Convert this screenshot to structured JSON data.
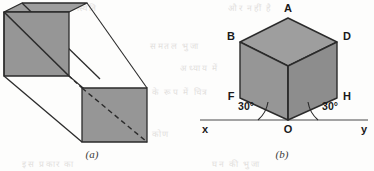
{
  "page": {
    "width": 374,
    "height": 171,
    "background_color": "#fdfdfc"
  },
  "style": {
    "fill_gray": "#969696",
    "fill_gray_light": "#9e9e9e",
    "fill_gray_dark": "#8d8d8d",
    "stroke_color": "#2b2b2b",
    "axis_color": "#4a4a4a",
    "label_color": "#1a1a1a",
    "stroke_width": 1.3
  },
  "figures": [
    {
      "id": "figure-a",
      "caption": "(a)",
      "type": "oblique-square-prism",
      "description": "Long square prism in oblique projection running from upper-left to lower-right, with the near square face and the far square face shaded and each crossed by a diagonal; the far diagonal is dashed because it is hidden.",
      "front_face": {
        "name": "near-square-face",
        "points": "4,12 69,12 69,76 4,76",
        "diagonal": {
          "from": "4,12",
          "to": "69,76",
          "style": "solid"
        }
      },
      "top_cap_face": {
        "name": "top-cap-face",
        "points": "4,12 22,3 87,3 69,12"
      },
      "back_face": {
        "name": "far-square-face",
        "points": "82,88 147,88 147,142 82,142",
        "diagonal": {
          "from": "82,88",
          "to": "147,142",
          "style": "dashed"
        }
      },
      "connector_edges": [
        {
          "name": "edge-top-left",
          "from": "22,3",
          "to": "99,79"
        },
        {
          "name": "edge-top-right",
          "from": "87,3",
          "to": "147,88"
        },
        {
          "name": "edge-bottom-left",
          "from": "4,76",
          "to": "82,142"
        },
        {
          "name": "edge-inner-dashed",
          "from": "69,76",
          "to": "82,88",
          "style": "dashed"
        }
      ]
    },
    {
      "id": "figure-b",
      "caption": "(b)",
      "type": "isometric-cube-on-vertex",
      "description": "Cube drawn in isometric projection balanced on vertex O which rests on a horizontal axis; the axis runs from x on the left to y on the right and two 30 degree angles are marked at O.",
      "vertices": [
        {
          "name": "A",
          "label": "A",
          "x": 288,
          "y": 18,
          "label_x": 285,
          "label_y": 4
        },
        {
          "name": "B",
          "label": "B",
          "x": 240,
          "y": 42,
          "label_x": 226,
          "label_y": 34
        },
        {
          "name": "D",
          "label": "D",
          "x": 337,
          "y": 42,
          "label_x": 343,
          "label_y": 34
        },
        {
          "name": "C",
          "label": "",
          "x": 288,
          "y": 66,
          "label_x": 0,
          "label_y": 0
        },
        {
          "name": "F",
          "label": "F",
          "x": 240,
          "y": 98,
          "label_x": 226,
          "label_y": 90
        },
        {
          "name": "H",
          "label": "H",
          "x": 337,
          "y": 98,
          "label_x": 343,
          "label_y": 90
        },
        {
          "name": "O",
          "label": "O",
          "x": 288,
          "y": 120,
          "label_x": 284,
          "label_y": 122
        }
      ],
      "faces": [
        {
          "name": "top-face",
          "points": "288,18 337,42 288,66 240,42",
          "shade": "#9e9e9e"
        },
        {
          "name": "left-front-face",
          "points": "240,42 288,66 288,120 240,98",
          "shade": "#969696"
        },
        {
          "name": "right-front-face",
          "points": "288,66 337,42 337,98 288,120",
          "shade": "#8d8d8d"
        }
      ],
      "axis": {
        "name": "horizontal-axis",
        "from_x": 200,
        "to_x": 368,
        "y": 120,
        "left_label": "x",
        "right_label": "y",
        "left_label_x": 204,
        "right_label_x": 364,
        "label_y": 127
      },
      "angles": [
        {
          "name": "angle-left",
          "value": "30°",
          "label_x": 238,
          "label_y": 104,
          "arc_from": "252,120",
          "arc_to": "264,110"
        },
        {
          "name": "angle-right",
          "value": "30°",
          "label_x": 322,
          "label_y": 104,
          "arc_from": "324,120",
          "arc_to": "312,110"
        }
      ]
    }
  ],
  "background_bleed": [
    {
      "text": "के लिए यह स्थिति",
      "x": 28,
      "y": 2
    },
    {
      "text": "और नहीं है",
      "x": 228,
      "y": 2
    },
    {
      "text": "समतल भुजा",
      "x": 150,
      "y": 40
    },
    {
      "text": "अध्याय में",
      "x": 180,
      "y": 62
    },
    {
      "text": "के रूप में चित्र",
      "x": 152,
      "y": 86
    },
    {
      "text": "भुजा और कोण",
      "x": 112,
      "y": 128
    },
    {
      "text": "इस प्रकार का",
      "x": 22,
      "y": 158
    },
    {
      "text": "घन की भुजा",
      "x": 212,
      "y": 158
    }
  ]
}
